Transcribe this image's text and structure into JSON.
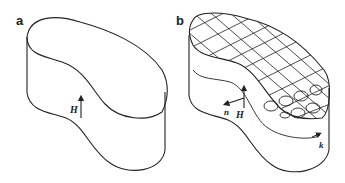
{
  "figure": {
    "panels": [
      {
        "id": "a",
        "label": "a",
        "description": "Kidney-shaped superconducting sample outline with applied field arrow",
        "symbols": {
          "field": "H"
        }
      },
      {
        "id": "b",
        "label": "b",
        "description": "Same sample with grid on top surface and vortex current loops near edge; surface normal and current direction indicated",
        "symbols": {
          "field": "H",
          "normal": "n",
          "current": "k"
        }
      }
    ],
    "colors": {
      "stroke": "#222222",
      "background": "#ffffff"
    }
  }
}
